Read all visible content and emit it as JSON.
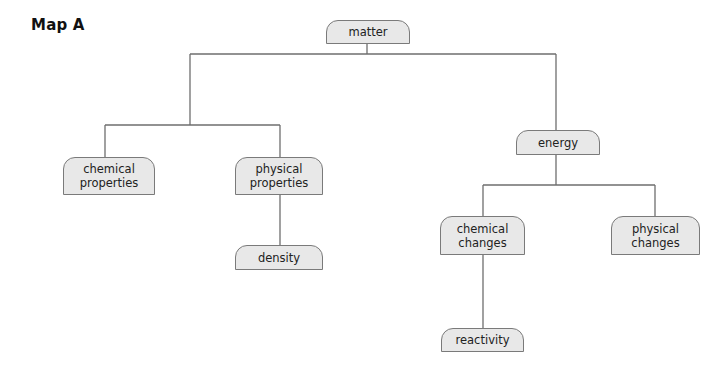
{
  "title": "Map A",
  "nodes": {
    "matter": {
      "label": "matter"
    },
    "chemical_properties": {
      "line1": "chemical",
      "line2": "properties"
    },
    "physical_properties": {
      "line1": "physical",
      "line2": "properties"
    },
    "density": {
      "label": "density"
    },
    "energy": {
      "label": "energy"
    },
    "chemical_changes": {
      "line1": "chemical",
      "line2": "changes"
    },
    "physical_changes": {
      "line1": "physical",
      "line2": "changes"
    },
    "reactivity": {
      "label": "reactivity"
    }
  },
  "edges": [
    [
      "matter",
      "chemical_properties"
    ],
    [
      "matter",
      "physical_properties"
    ],
    [
      "matter",
      "energy"
    ],
    [
      "physical_properties",
      "density"
    ],
    [
      "energy",
      "chemical_changes"
    ],
    [
      "energy",
      "physical_changes"
    ],
    [
      "chemical_changes",
      "reactivity"
    ]
  ],
  "colors": {
    "node_fill": "#e8e8e8",
    "node_border": "#7a7a7a",
    "line": "#6e6e6e"
  }
}
